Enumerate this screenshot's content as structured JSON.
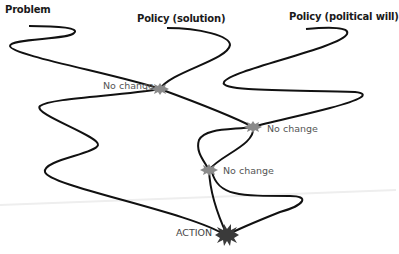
{
  "diagram": {
    "titles": {
      "problem": "Problem",
      "policy_solution": "Policy (solution)",
      "policy_political_will": "Policy (political will)"
    },
    "nodes": [
      {
        "label": "No change",
        "x": 160,
        "y": 89
      },
      {
        "label": "No change",
        "x": 253,
        "y": 127
      },
      {
        "label": "No change",
        "x": 209,
        "y": 170
      }
    ],
    "outcome": {
      "label": "ACTION",
      "x": 227,
      "y": 235
    },
    "colors": {
      "stroke": "#111111",
      "node_fill": "#8a8a8a",
      "action_fill": "#3a3a3a",
      "label_gray": "#555555"
    }
  }
}
